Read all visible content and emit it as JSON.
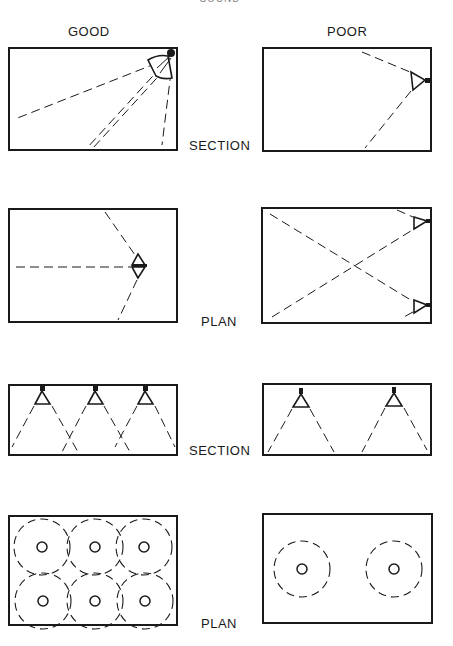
{
  "caption_top": "SOUND REINFORCEMENT",
  "columns": [
    {
      "id": "good",
      "label": "GOOD"
    },
    {
      "id": "poor",
      "label": "POOR"
    }
  ],
  "rows": [
    {
      "id": "row1",
      "label": "SECTION"
    },
    {
      "id": "row2",
      "label": "PLAN"
    },
    {
      "id": "row3",
      "label": "SECTION"
    },
    {
      "id": "row4",
      "label": "PLAN"
    }
  ],
  "panels": {
    "good_section_1": {
      "description": "Single central cluster in upper-right corner, aimed down and across the room"
    },
    "poor_section_1": {
      "description": "Single speaker mounted on right wall, aimed horizontally"
    },
    "good_plan_1": {
      "description": "Speaker cluster mid-room, covering full width"
    },
    "poor_plan_1": {
      "description": "Two speakers on right wall with crossing coverage"
    },
    "good_section_2": {
      "description": "Three ceiling speakers with overlapping coverage"
    },
    "poor_section_2": {
      "description": "Two ceiling speakers, gaps between coverage"
    },
    "good_plan_2": {
      "description": "Six ceiling speakers, overlapping coverage circles",
      "speaker_count": 6
    },
    "poor_plan_2": {
      "description": "Two ceiling speakers, isolated coverage circles",
      "speaker_count": 2
    }
  },
  "colors": {
    "ink": "#1a1a1a",
    "background": "#ffffff"
  }
}
